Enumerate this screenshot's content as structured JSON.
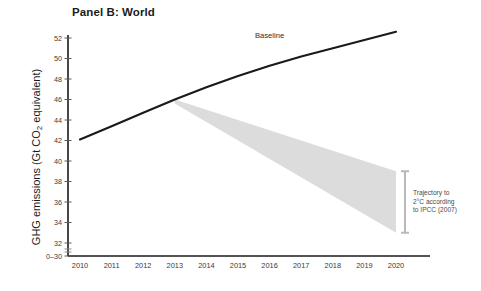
{
  "chart_data": {
    "type": "line",
    "title": "Panel B: World",
    "xlabel": "",
    "ylabel": "GHG emissions (Gt CO2 equivalent)",
    "ylabel_parts": {
      "pre": "GHG emissions (Gt CO",
      "sub": "2",
      "post": " equivalent)"
    },
    "x": [
      2010,
      2011,
      2012,
      2013,
      2014,
      2015,
      2016,
      2017,
      2018,
      2019,
      2020
    ],
    "xticks": [
      "2010",
      "2011",
      "2012",
      "2013",
      "2014",
      "2015",
      "2016",
      "2017",
      "2018",
      "2019",
      "2020"
    ],
    "yticks": [
      "0–30",
      "32",
      "34",
      "36",
      "38",
      "40",
      "42",
      "44",
      "46",
      "48",
      "50",
      "52"
    ],
    "ytick_values": [
      30,
      32,
      34,
      36,
      38,
      40,
      42,
      44,
      46,
      48,
      50,
      52
    ],
    "ylim": [
      30,
      52
    ],
    "xlim": [
      2009.6,
      2020.9
    ],
    "axis_break": true,
    "grid": false,
    "legend_position": "inline-annotation",
    "series": [
      {
        "name": "Baseline",
        "label": "Baseline",
        "color": "#1a1a1a",
        "values": [
          42.1,
          43.4,
          44.7,
          46.0,
          47.2,
          48.3,
          49.3,
          50.2,
          51.0,
          51.8,
          52.6
        ]
      }
    ],
    "wedge": {
      "name": "Trajectory to 2°C according to IPCC (2007)",
      "color": "#dcdcdc",
      "apex": {
        "x": 2013,
        "y": 46.0
      },
      "upper": [
        {
          "x": 2013,
          "y": 46.0
        },
        {
          "x": 2020,
          "y": 39.0
        }
      ],
      "lower": [
        {
          "x": 2013,
          "y": 45.6
        },
        {
          "x": 2020,
          "y": 33.0
        }
      ],
      "endpoint_range": [
        33.0,
        39.0
      ]
    },
    "annotations": [
      {
        "name": "baseline-label",
        "text": "Baseline",
        "x": 2016.0,
        "y": 52.0
      },
      {
        "name": "trajectory-label",
        "lines": [
          "Trajectory to",
          "2°C according",
          "to IPCC (2007)"
        ],
        "x": 2020.5,
        "y": 36.0
      }
    ],
    "error_bar": {
      "name": "2020-range-bracket",
      "x": 2020,
      "low": 33.0,
      "high": 39.0,
      "color": "#b9b9b9"
    }
  }
}
